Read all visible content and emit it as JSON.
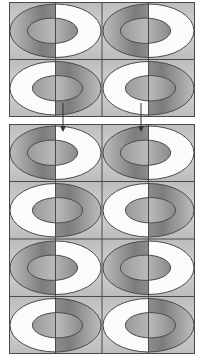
{
  "figure": {
    "width": 202,
    "height": 362,
    "background": "#ffffff",
    "cell_bg": "#c9c9c9",
    "grid_line_color": "#4a4a4a",
    "ring_line_color": "#4a4a4a",
    "white_half_color": "#fbfbfb",
    "gray_dark": "#7a7a7a",
    "gray_light": "#cfcfcf"
  },
  "top_grid": {
    "x": 9,
    "y": 2,
    "col_width": 93,
    "row_height": 57.5,
    "rows": [
      [
        "white-right",
        "white-right"
      ],
      [
        "white-left",
        "white-left"
      ]
    ]
  },
  "bottom_grid": {
    "x": 9,
    "y": 124,
    "col_width": 93,
    "row_height": 57.5,
    "rows": [
      [
        "white-right",
        "white-right"
      ],
      [
        "white-left",
        "white-left"
      ],
      [
        "white-right",
        "white-right"
      ],
      [
        "white-left",
        "white-left"
      ]
    ]
  },
  "arrows": [
    {
      "x": 63,
      "y1": 103,
      "y2": 132,
      "color": "#333333"
    },
    {
      "x": 141,
      "y1": 103,
      "y2": 132,
      "color": "#333333"
    }
  ]
}
